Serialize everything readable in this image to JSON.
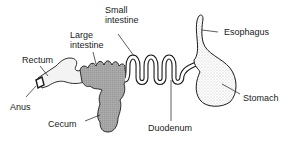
{
  "diagram": {
    "labels": {
      "small_intestine_line1": "Small",
      "small_intestine_line2": "intestine",
      "large_intestine_line1": "Large",
      "large_intestine_line2": "intestine",
      "rectum": "Rectum",
      "esophagus": "Esophagus",
      "anus": "Anus",
      "cecum": "Cecum",
      "duodenum": "Duodenum",
      "stomach": "Stomach"
    },
    "colors": {
      "outline": "#1a1a1a",
      "large_intestine_fill": "#a8a8a8",
      "stomach_fill": "#e8e8e8",
      "rectum_fill": "#f4f4f4"
    }
  }
}
